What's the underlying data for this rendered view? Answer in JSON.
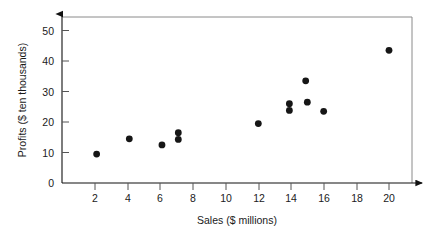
{
  "chart_data": {
    "type": "scatter",
    "title": "",
    "xlabel": "Sales ($ millions)",
    "ylabel": "Profits ($ ten thousands)",
    "xlim": [
      0,
      21.5
    ],
    "ylim": [
      0,
      57
    ],
    "xticks": [
      2,
      4,
      6,
      8,
      10,
      12,
      14,
      16,
      18,
      20
    ],
    "yticks": [
      0,
      10,
      20,
      30,
      40,
      50
    ],
    "xtick_labels": [
      "2",
      "4",
      "6",
      "8",
      "10",
      "12",
      "14",
      "16",
      "18",
      "20"
    ],
    "ytick_labels": [
      "0",
      "10",
      "20",
      "30",
      "40",
      "50"
    ],
    "grid": false,
    "legend": null,
    "marker": "filled-circle",
    "marker_color": "#161616",
    "points": [
      {
        "x": 2.1,
        "y": 9.5
      },
      {
        "x": 4.1,
        "y": 14.5
      },
      {
        "x": 6.1,
        "y": 12.5
      },
      {
        "x": 7.1,
        "y": 16.5
      },
      {
        "x": 7.1,
        "y": 14.3
      },
      {
        "x": 12.0,
        "y": 19.5
      },
      {
        "x": 13.9,
        "y": 26.0
      },
      {
        "x": 13.9,
        "y": 23.8
      },
      {
        "x": 14.9,
        "y": 33.5
      },
      {
        "x": 15.0,
        "y": 26.5
      },
      {
        "x": 16.0,
        "y": 23.5
      },
      {
        "x": 20.0,
        "y": 43.5
      }
    ]
  },
  "axes": {
    "x_arrow": "arrow-right",
    "y_arrow": "arrow-up"
  },
  "colors": {
    "marker": "#161616",
    "axis": "#111111",
    "frame": "#8a8a8a",
    "background": "#ffffff"
  }
}
